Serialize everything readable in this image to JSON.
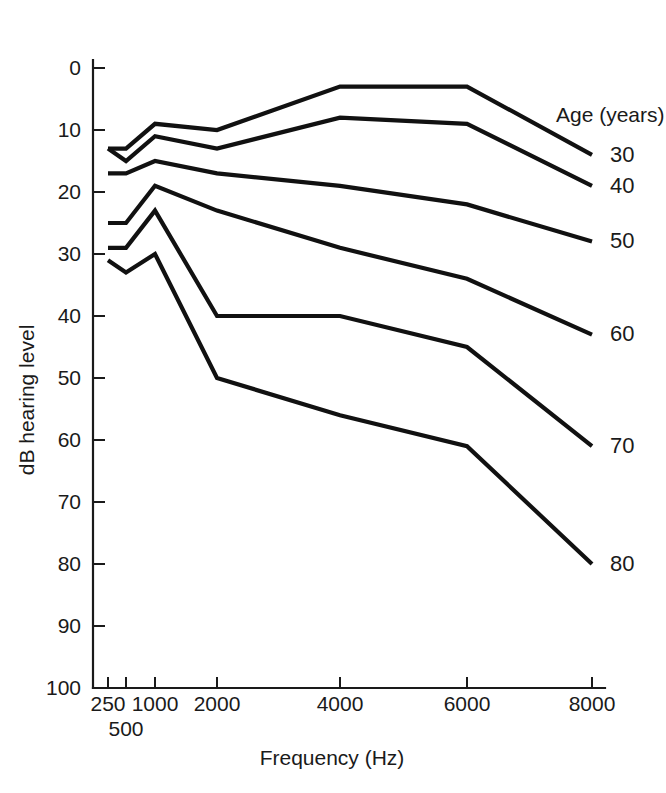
{
  "chart_data": {
    "type": "line",
    "title": "",
    "xlabel": "Frequency (Hz)",
    "ylabel": "dB hearing level",
    "legend_title": "Age (years)",
    "legend_position": "right",
    "grid": false,
    "x_scale": "log-ish-categorical",
    "x": [
      250,
      500,
      1000,
      2000,
      4000,
      6000,
      8000
    ],
    "xtick_labels": [
      "250",
      "500",
      "1000",
      "2000",
      "4000",
      "6000",
      "8000"
    ],
    "ytick_labels": [
      "0",
      "10",
      "20",
      "30",
      "40",
      "50",
      "60",
      "70",
      "80",
      "90",
      "100"
    ],
    "ylim": [
      0,
      100
    ],
    "y_inverted": true,
    "ytick_step": 10,
    "series": [
      {
        "name": "30",
        "label": "30",
        "values": [
          13,
          13,
          9,
          10,
          3,
          3,
          14
        ]
      },
      {
        "name": "40",
        "label": "40",
        "values": [
          13,
          15,
          11,
          13,
          8,
          9,
          19
        ]
      },
      {
        "name": "50",
        "label": "50",
        "values": [
          17,
          17,
          15,
          17,
          19,
          22,
          28
        ]
      },
      {
        "name": "60",
        "label": "60",
        "values": [
          25,
          25,
          19,
          23,
          29,
          34,
          43
        ]
      },
      {
        "name": "70",
        "label": "70",
        "values": [
          29,
          29,
          23,
          40,
          40,
          45,
          61
        ]
      },
      {
        "name": "80",
        "label": "80",
        "values": [
          31,
          33,
          30,
          50,
          56,
          61,
          80
        ]
      }
    ]
  }
}
